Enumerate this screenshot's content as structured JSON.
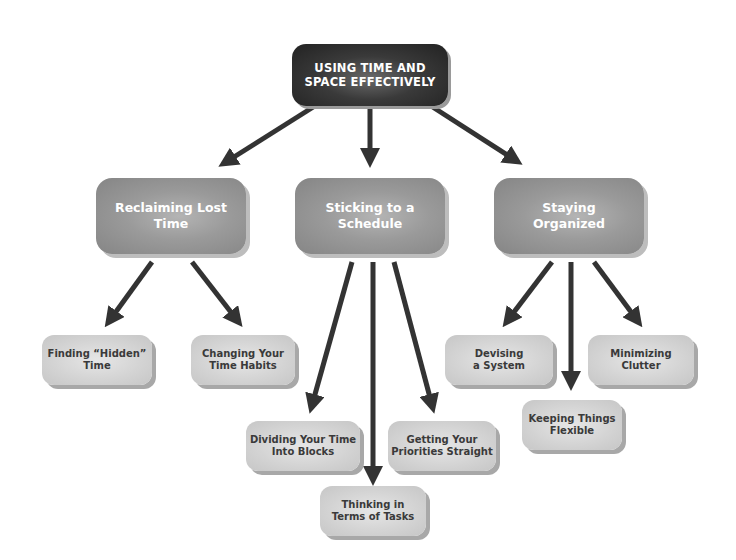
{
  "diagram": {
    "type": "concept-map",
    "root": {
      "label_line1": "USING TIME AND",
      "label_line2": "SPACE EFFECTIVELY"
    },
    "branches": [
      {
        "label_line1": "Reclaiming Lost",
        "label_line2": "Time",
        "children": [
          {
            "label_line1": "Finding “Hidden”",
            "label_line2": "Time"
          },
          {
            "label_line1": "Changing Your",
            "label_line2": "Time Habits"
          }
        ]
      },
      {
        "label_line1": "Sticking to a",
        "label_line2": "Schedule",
        "children": [
          {
            "label_line1": "Dividing Your Time",
            "label_line2": "Into Blocks"
          },
          {
            "label_line1": "Thinking in",
            "label_line2": "Terms of Tasks"
          },
          {
            "label_line1": "Getting Your",
            "label_line2": "Priorities Straight"
          }
        ]
      },
      {
        "label_line1": "Staying",
        "label_line2": "Organized",
        "children": [
          {
            "label_line1": "Devising",
            "label_line2": "a System"
          },
          {
            "label_line1": "Keeping Things",
            "label_line2": "Flexible"
          },
          {
            "label_line1": "Minimizing",
            "label_line2": "Clutter"
          }
        ]
      }
    ],
    "colors": {
      "root_fill": "#2e2e2e",
      "branch_fill": "#9a9a9a",
      "leaf_fill": "#d6d6d6",
      "arrow": "#333333",
      "leaf_text": "#3a3a3a"
    }
  }
}
